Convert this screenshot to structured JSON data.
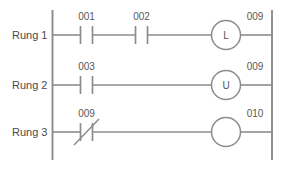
{
  "diagram": {
    "line_color": "#8c8c8c",
    "text_color": "#4a4a4a",
    "background": "#ffffff"
  },
  "rungs": [
    {
      "name": "Rung 1",
      "contacts": [
        {
          "address": "001",
          "type": "normally-open"
        },
        {
          "address": "002",
          "type": "normally-open"
        }
      ],
      "coil": {
        "address": "009",
        "letter": "L",
        "type": "latch-coil"
      }
    },
    {
      "name": "Rung 2",
      "contacts": [
        {
          "address": "003",
          "type": "normally-open"
        }
      ],
      "coil": {
        "address": "009",
        "letter": "U",
        "type": "unlatch-coil"
      }
    },
    {
      "name": "Rung 3",
      "contacts": [
        {
          "address": "009",
          "type": "normally-closed"
        }
      ],
      "coil": {
        "address": "010",
        "letter": "",
        "type": "output-coil"
      }
    }
  ]
}
